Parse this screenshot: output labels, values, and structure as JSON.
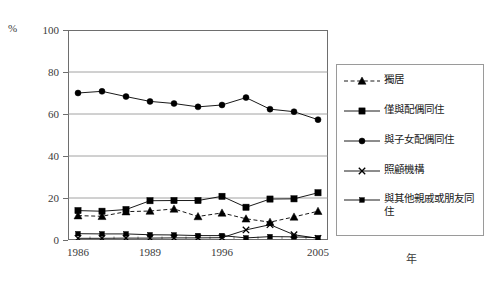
{
  "axis": {
    "y_unit_label": "%",
    "x_unit_label": "年",
    "y_ticks": [
      "0",
      "20",
      "40",
      "60",
      "80",
      "100"
    ],
    "x_ticks": [
      "1986",
      "1989",
      "1996",
      "2005"
    ]
  },
  "legend": {
    "items": [
      {
        "label": "獨居",
        "marker": "triangle-marker",
        "dash": "dashed",
        "color": "#000000"
      },
      {
        "label": "僅與配偶同住",
        "marker": "square-marker",
        "dash": "solid",
        "color": "#000000"
      },
      {
        "label": "與子女配偶同住",
        "marker": "circle-marker",
        "dash": "solid",
        "color": "#000000"
      },
      {
        "label": "照顧機構",
        "marker": "x-marker",
        "dash": "solid",
        "color": "#000000"
      },
      {
        "label": "與其他親戚或朋友同住",
        "marker": "small-square-marker",
        "dash": "solid",
        "color": "#000000"
      }
    ]
  },
  "chart_data": {
    "type": "line",
    "title": "",
    "xlabel": "年",
    "ylabel": "%",
    "ylim": [
      0,
      100
    ],
    "yticks": [
      0,
      20,
      40,
      60,
      80,
      100
    ],
    "grid": true,
    "legend_position": "right",
    "x": [
      "1986",
      "1987",
      "1988",
      "1989",
      "1991",
      "1993",
      "1996",
      "1999",
      "2002",
      "2003",
      "2005"
    ],
    "xtick_labels": [
      "1986",
      "1989",
      "1996",
      "2005"
    ],
    "series": [
      {
        "name": "獨居",
        "marker": "triangle",
        "linestyle": "dashed",
        "values": [
          11.6,
          11.3,
          13.5,
          13.8,
          14.8,
          11.2,
          12.9,
          10.1,
          8.5,
          11.0,
          13.7
        ]
      },
      {
        "name": "僅與配偶同住",
        "marker": "square",
        "linestyle": "solid",
        "values": [
          14.0,
          13.7,
          14.5,
          18.7,
          18.8,
          18.8,
          20.8,
          15.6,
          19.5,
          19.6,
          22.5
        ]
      },
      {
        "name": "與子女配偶同住",
        "marker": "circle",
        "linestyle": "solid",
        "values": [
          70.0,
          70.8,
          68.3,
          66.0,
          65.0,
          63.4,
          64.3,
          67.8,
          62.3,
          61.1,
          57.3
        ]
      },
      {
        "name": "照顧機構",
        "marker": "x",
        "linestyle": "solid",
        "values": [
          0.8,
          0.8,
          0.9,
          0.9,
          1.0,
          1.0,
          1.1,
          4.8,
          7.3,
          2.5,
          0.8
        ]
      },
      {
        "name": "與其他親戚或朋友同住",
        "marker": "small-square",
        "linestyle": "solid",
        "values": [
          3.0,
          2.9,
          2.9,
          2.5,
          2.4,
          2.1,
          2.1,
          1.0,
          1.6,
          1.5,
          1.1
        ]
      }
    ]
  }
}
